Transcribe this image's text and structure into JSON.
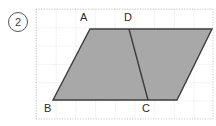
{
  "figure": {
    "item_number": "2",
    "description_kind": "geometry-grid-figure",
    "canvas": {
      "width": 216,
      "height": 126,
      "background": "#ffffff"
    },
    "grid": {
      "style": "dotted",
      "color": "#b9b9b9",
      "left": 36,
      "top": 9,
      "right": 213,
      "bottom": 119,
      "cell_width": 19.7,
      "cell_height": 18.3,
      "columns": 9,
      "rows": 6
    },
    "shape": {
      "name": "parallelogram",
      "fill": "#a8a8a8",
      "stroke": "#3c3c3c",
      "stroke_width": 1.4,
      "points": "90,29 212,29 177,100 53,100"
    },
    "divider": {
      "name": "segment-DC",
      "stroke": "#3c3c3c",
      "stroke_width": 1.4,
      "x1": 129,
      "y1": 29,
      "x2": 148,
      "y2": 100
    },
    "labels": {
      "A": "A",
      "B": "B",
      "C": "C",
      "D": "D"
    }
  }
}
